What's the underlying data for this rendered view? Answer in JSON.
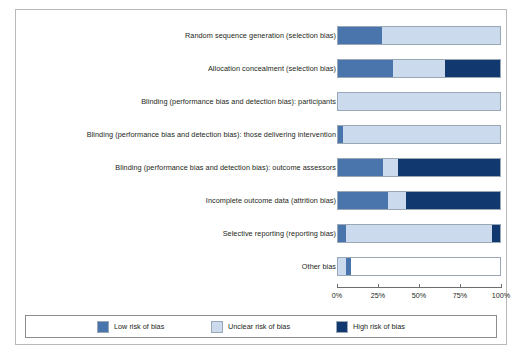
{
  "chart_data": {
    "type": "bar",
    "orientation": "horizontal",
    "stacked": true,
    "normalized": true,
    "title": "",
    "xlabel": "",
    "ylabel": "",
    "xlim": [
      0,
      100
    ],
    "xticks": [
      0,
      25,
      50,
      75,
      100
    ],
    "xtick_labels": [
      "0%",
      "25%",
      "50%",
      "75%",
      "100%"
    ],
    "grid": false,
    "legend_position": "bottom",
    "categories": [
      "Random sequence generation (selection bias)",
      "Allocation concealment (selection bias)",
      "Blinding (performance bias and detection bias): participants",
      "Blinding (performance bias and detection bias): those delivering intervention",
      "Blinding (performance bias and detection bias): outcome assessors",
      "Incomplete outcome data (attrition bias)",
      "Selective reporting (reporting bias)",
      "Other bias"
    ],
    "series": [
      {
        "name": "Low risk of bias",
        "color": "#4a74ac",
        "values": [
          27,
          34,
          0,
          3,
          28,
          31,
          5,
          0
        ]
      },
      {
        "name": "Unclear risk of bias",
        "color": "#cbdaec",
        "values": [
          73,
          32,
          100,
          97,
          9,
          11,
          90,
          5
        ]
      },
      {
        "name": "High risk of bias",
        "color": "#11386f",
        "values": [
          0,
          34,
          0,
          0,
          63,
          58,
          5,
          0
        ]
      }
    ],
    "rows": [
      {
        "label": "Random sequence generation (selection bias)",
        "segments": [
          {
            "kind": "low",
            "pct": 27
          },
          {
            "kind": "unclear",
            "pct": 73
          }
        ]
      },
      {
        "label": "Allocation concealment (selection bias)",
        "segments": [
          {
            "kind": "low",
            "pct": 34
          },
          {
            "kind": "unclear",
            "pct": 32
          },
          {
            "kind": "high",
            "pct": 34
          }
        ]
      },
      {
        "label": "Blinding (performance bias and detection bias): participants",
        "segments": [
          {
            "kind": "unclear",
            "pct": 100
          }
        ]
      },
      {
        "label": "Blinding (performance bias and detection bias): those delivering intervention",
        "segments": [
          {
            "kind": "low",
            "pct": 3
          },
          {
            "kind": "unclear",
            "pct": 97
          }
        ]
      },
      {
        "label": "Blinding (performance bias and detection bias): outcome assessors",
        "segments": [
          {
            "kind": "low",
            "pct": 28
          },
          {
            "kind": "unclear",
            "pct": 9
          },
          {
            "kind": "high",
            "pct": 63
          }
        ]
      },
      {
        "label": "Incomplete outcome data (attrition bias)",
        "segments": [
          {
            "kind": "low",
            "pct": 31
          },
          {
            "kind": "unclear",
            "pct": 11
          },
          {
            "kind": "high",
            "pct": 58
          }
        ]
      },
      {
        "label": "Selective reporting (reporting bias)",
        "segments": [
          {
            "kind": "low",
            "pct": 5
          },
          {
            "kind": "unclear",
            "pct": 90
          },
          {
            "kind": "high",
            "pct": 5
          }
        ]
      },
      {
        "label": "Other bias",
        "segments": [
          {
            "kind": "unclear",
            "pct": 5
          },
          {
            "kind": "low",
            "pct": 3
          }
        ]
      }
    ],
    "legend": [
      {
        "label": "Low risk of bias",
        "kind": "low",
        "color": "#4a74ac"
      },
      {
        "label": "Unclear risk of bias",
        "kind": "unclear",
        "color": "#cbdaec"
      },
      {
        "label": "High risk of bias",
        "kind": "high",
        "color": "#11386f"
      }
    ]
  }
}
